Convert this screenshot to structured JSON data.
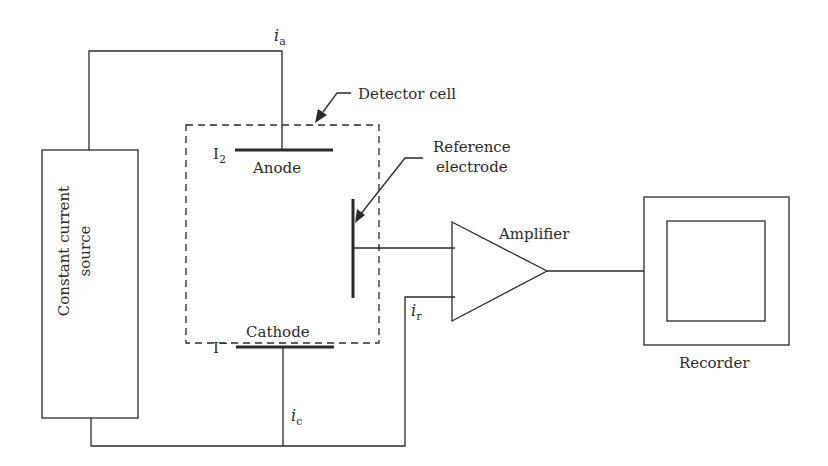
{
  "diagram": {
    "components": {
      "source": {
        "line1": "Constant current",
        "line2": "source"
      },
      "detector_cell": {
        "label": "Detector cell"
      },
      "anode": {
        "label": "Anode",
        "species_main": "I",
        "species_sub": "2"
      },
      "cathode": {
        "label": "Cathode",
        "species_main": "I",
        "species_sup": "−"
      },
      "reference_electrode": {
        "line1": "Reference",
        "line2": "electrode"
      },
      "amplifier": {
        "label": "Amplifier"
      },
      "recorder": {
        "label": "Recorder"
      }
    },
    "currents": {
      "anode": {
        "symbol": "i",
        "sub": "a"
      },
      "cathode": {
        "symbol": "i",
        "sub": "c"
      },
      "reference": {
        "symbol": "i",
        "sub": "r"
      }
    },
    "colors": {
      "line": "#2a2a2a",
      "background": "#ffffff"
    }
  }
}
